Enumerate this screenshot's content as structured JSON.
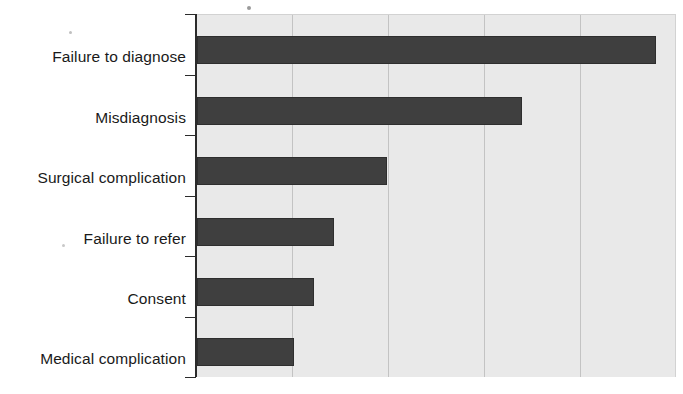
{
  "chart_data": {
    "type": "bar",
    "orientation": "horizontal",
    "title": "",
    "subtitle": "",
    "xlabel": "",
    "ylabel": "",
    "categories": [
      "Failure to diagnose",
      "Misdiagnosis",
      "Surgical complication",
      "Failure to refer",
      "Consent",
      "Medical complication"
    ],
    "values": [
      4.78,
      3.39,
      1.98,
      1.43,
      1.22,
      1.01
    ],
    "series": [
      {
        "name": "Claims",
        "values": [
          4.78,
          3.39,
          1.98,
          1.43,
          1.22,
          1.01
        ]
      }
    ],
    "xlim": [
      0,
      5.0
    ],
    "ylim": null,
    "x_tick_labels": [],
    "y_tick_labels": [
      "Failure to diagnose",
      "Misdiagnosis",
      "Surgical complication",
      "Failure to refer",
      "Consent",
      "Medical complication"
    ],
    "gridlines": {
      "vertical": [
        1,
        2,
        3,
        4
      ],
      "horizontal": []
    },
    "grid": true,
    "legend": null,
    "legend_position": "none",
    "annotations": []
  },
  "style": {
    "bar_color": "#3f3f3f",
    "bar_border_color": "#2e2e2e",
    "plot_background": "#e9e9e9",
    "page_background": "#ffffff",
    "axis_color": "#2b2b2b",
    "gridline_color": "#c3c3c3",
    "label_color": "#1a1a1a"
  },
  "axis": {
    "tick_count": 7,
    "tick_positions_px": [
      14,
      74.5,
      135,
      195.5,
      256,
      316.5,
      377
    ]
  },
  "geometry": {
    "plot_left_px": 197,
    "plot_right_px": 676,
    "plot_top_px": 14,
    "plot_bottom_px": 377,
    "unit_px": 96,
    "bar_height_px": 28,
    "bar_tops_px": [
      35,
      96,
      156,
      217,
      277,
      337
    ]
  },
  "artifacts": [
    {
      "name": "scan-speck-top",
      "x": 247,
      "y": 6,
      "size": 4
    },
    {
      "name": "scan-speck-left-upper",
      "x": 69,
      "y": 31,
      "size": 3
    },
    {
      "name": "scan-speck-left-lower",
      "x": 62,
      "y": 244,
      "size": 3
    }
  ]
}
